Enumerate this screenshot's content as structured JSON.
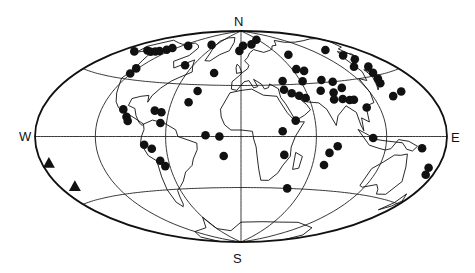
{
  "map": {
    "projection": "Hammer-Aitoff (equal-area world)",
    "compass_labels": {
      "north": "N",
      "south": "S",
      "west": "W",
      "east": "E"
    },
    "graticule": {
      "meridian_spacing_deg": 60,
      "parallels_deg": [
        -40,
        0,
        40
      ]
    },
    "marker_color": "#111111",
    "legend": null,
    "markers": [
      {
        "type": "dot",
        "lon": -163,
        "lat": 57
      },
      {
        "type": "dot",
        "lon": -150,
        "lat": 60
      },
      {
        "type": "dot",
        "lon": -142,
        "lat": 60
      },
      {
        "type": "dot",
        "lon": -137,
        "lat": 61
      },
      {
        "type": "dot",
        "lon": -133,
        "lat": 62
      },
      {
        "type": "dot",
        "lon": -128,
        "lat": 64
      },
      {
        "type": "dot",
        "lon": -126,
        "lat": 66
      },
      {
        "type": "dot",
        "lon": -110,
        "lat": 70
      },
      {
        "type": "dot",
        "lon": -70,
        "lat": 74
      },
      {
        "type": "dot",
        "lon": -70,
        "lat": 55
      },
      {
        "type": "dot",
        "lon": -122,
        "lat": 48
      },
      {
        "type": "dot",
        "lon": -121,
        "lat": 44
      },
      {
        "type": "dot",
        "lon": -100,
        "lat": 19
      },
      {
        "type": "dot",
        "lon": -95,
        "lat": 14
      },
      {
        "type": "dot",
        "lon": -93,
        "lat": 11
      },
      {
        "type": "dot",
        "lon": -72,
        "lat": 19
      },
      {
        "type": "dot",
        "lon": -66,
        "lat": 18
      },
      {
        "type": "dot",
        "lon": -65,
        "lat": 10
      },
      {
        "type": "dot",
        "lon": -30,
        "lat": 50
      },
      {
        "type": "dot",
        "lon": -40,
        "lat": 35
      },
      {
        "type": "dot",
        "lon": -45,
        "lat": 26
      },
      {
        "type": "dot",
        "lon": -78,
        "lat": -6
      },
      {
        "type": "dot",
        "lon": -72,
        "lat": -9
      },
      {
        "type": "dot",
        "lon": -67,
        "lat": -18
      },
      {
        "type": "dot",
        "lon": -64,
        "lat": -22
      },
      {
        "type": "dot",
        "lon": -28,
        "lat": 1
      },
      {
        "type": "dot",
        "lon": -17,
        "lat": 0
      },
      {
        "type": "dot",
        "lon": -14,
        "lat": -15
      },
      {
        "type": "dot",
        "lon": -3,
        "lat": 70
      },
      {
        "type": "dot",
        "lon": 5,
        "lat": 75
      },
      {
        "type": "dot",
        "lon": 27,
        "lat": 76
      },
      {
        "type": "dot",
        "lon": 55,
        "lat": 80
      },
      {
        "type": "dot",
        "lon": 75,
        "lat": 64
      },
      {
        "type": "dot",
        "lon": 65,
        "lat": 52
      },
      {
        "type": "dot",
        "lon": 72,
        "lat": 50
      },
      {
        "type": "dot",
        "lon": 42,
        "lat": 43
      },
      {
        "type": "dot",
        "lon": 40,
        "lat": 36
      },
      {
        "type": "dot",
        "lon": 46,
        "lat": 33
      },
      {
        "type": "dot",
        "lon": 52,
        "lat": 31
      },
      {
        "type": "dot",
        "lon": 57,
        "lat": 29
      },
      {
        "type": "dot",
        "lon": 62,
        "lat": 42
      },
      {
        "type": "dot",
        "lon": 82,
        "lat": 42
      },
      {
        "type": "dot",
        "lon": 92,
        "lat": 40
      },
      {
        "type": "dot",
        "lon": 96,
        "lat": 35
      },
      {
        "type": "dot",
        "lon": 85,
        "lat": 32
      },
      {
        "type": "dot",
        "lon": 90,
        "lat": 27
      },
      {
        "type": "dot",
        "lon": 96,
        "lat": 26
      },
      {
        "type": "dot",
        "lon": 100,
        "lat": 26
      },
      {
        "type": "dot",
        "lon": 82,
        "lat": 27
      },
      {
        "type": "dot",
        "lon": 74,
        "lat": 34
      },
      {
        "type": "dot",
        "lon": 108,
        "lat": 20
      },
      {
        "type": "dot",
        "lon": 44,
        "lat": 12
      },
      {
        "type": "dot",
        "lon": 33,
        "lat": 4
      },
      {
        "type": "dot",
        "lon": 35,
        "lat": -14
      },
      {
        "type": "dot",
        "lon": 45,
        "lat": -40
      },
      {
        "type": "dot",
        "lon": 78,
        "lat": -7
      },
      {
        "type": "dot",
        "lon": 72,
        "lat": -12
      },
      {
        "type": "dot",
        "lon": 70,
        "lat": -21
      },
      {
        "type": "dot",
        "lon": 108,
        "lat": -1
      },
      {
        "type": "dot",
        "lon": 140,
        "lat": 62
      },
      {
        "type": "dot",
        "lon": 146,
        "lat": 56
      },
      {
        "type": "dot",
        "lon": 150,
        "lat": 52
      },
      {
        "type": "dot",
        "lon": 150,
        "lat": 46
      },
      {
        "type": "dot",
        "lon": 145,
        "lat": 42
      },
      {
        "type": "dot",
        "lon": 142,
        "lat": 38
      },
      {
        "type": "dot",
        "lon": 139,
        "lat": 35
      },
      {
        "type": "dot",
        "lon": 134,
        "lat": 48
      },
      {
        "type": "dot",
        "lon": 140,
        "lat": 26
      },
      {
        "type": "dot",
        "lon": 152,
        "lat": 28
      },
      {
        "type": "dot",
        "lon": 155,
        "lat": -7
      },
      {
        "type": "dot",
        "lon": 170,
        "lat": -18
      },
      {
        "type": "dot",
        "lon": 172,
        "lat": -22
      },
      {
        "type": "triangle",
        "lon": -172,
        "lat": -15
      },
      {
        "type": "triangle",
        "lon": -163,
        "lat": -30
      }
    ]
  }
}
